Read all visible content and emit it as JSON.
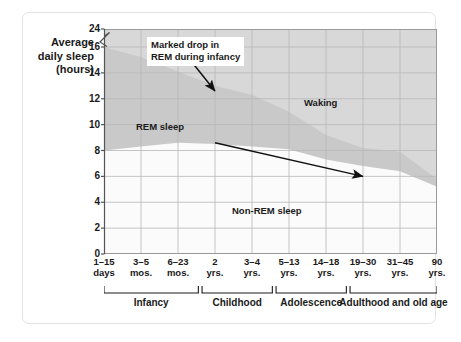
{
  "figure": {
    "y_axis_label_lines": [
      "Average",
      "daily sleep",
      "(hours)"
    ],
    "y_axis_title": "Average daily sleep (hours)"
  },
  "annotation": {
    "line1": "Marked drop in",
    "line2": "REM during infancy"
  },
  "region_labels": {
    "waking": "Waking",
    "rem": "REM sleep",
    "nonrem": "Non-REM sleep"
  },
  "brackets": [
    {
      "label": "Infancy",
      "start": 0,
      "end": 2.55
    },
    {
      "label": "Childhood",
      "start": 2.65,
      "end": 4.55
    },
    {
      "label": "Adolescence",
      "start": 4.65,
      "end": 6.55
    },
    {
      "label": "Adulthood and old age",
      "start": 6.65,
      "end": 9.0
    }
  ],
  "colors": {
    "waking_fill": "#d8d8d8",
    "rem_fill": "#c9c9c9",
    "nonrem_fill": "#fbfbfb",
    "grid": "#b8b8b8",
    "axis": "#555555",
    "text": "#1a1a1a",
    "frame": "#e3e3e3",
    "arrow": "#111111",
    "page_bg": "#ffffff"
  },
  "chart_data": {
    "type": "area",
    "title": "",
    "subtitle": "",
    "xlabel": "",
    "ylabel": "Average daily sleep (hours)",
    "ylim": [
      0,
      24
    ],
    "y_axis_break": {
      "between": [
        16,
        24
      ],
      "style": "zigzag"
    },
    "yticks": [
      0,
      2,
      4,
      6,
      8,
      10,
      12,
      14,
      16,
      24
    ],
    "ytick_labels": [
      "0",
      "2",
      "4",
      "6",
      "8",
      "10",
      "12",
      "14",
      "16",
      "24"
    ],
    "grid": true,
    "legend": "in-plot region labels",
    "categories": [
      "1–15 days",
      "3–5 mos.",
      "6–23 mos.",
      "2 yrs.",
      "3–4 yrs.",
      "5–13 yrs.",
      "14–18 yrs.",
      "19–30 yrs.",
      "31–45 yrs.",
      "90 yrs."
    ],
    "xtick_label_lines": [
      [
        "1–15",
        "days"
      ],
      [
        "3–5",
        "mos."
      ],
      [
        "6–23",
        "mos."
      ],
      [
        "2",
        "yrs."
      ],
      [
        "3–4",
        "yrs."
      ],
      [
        "5–13",
        "yrs."
      ],
      [
        "14–18",
        "yrs."
      ],
      [
        "19–30",
        "yrs."
      ],
      [
        "31–45",
        "yrs."
      ],
      [
        "90",
        "yrs."
      ]
    ],
    "series": [
      {
        "name": "Total sleep",
        "description": "Upper boundary of shaded sleep region; above it is Waking",
        "values": [
          16.0,
          15.2,
          14.1,
          13.0,
          12.3,
          11.0,
          9.2,
          8.2,
          7.9,
          5.8
        ]
      },
      {
        "name": "Non-REM sleep",
        "description": "Boundary between REM (upper band) and Non-REM (lower band)",
        "values": [
          8.0,
          8.3,
          8.6,
          8.5,
          8.3,
          8.1,
          7.3,
          6.8,
          6.4,
          5.2
        ]
      }
    ],
    "derived_series": [
      {
        "name": "REM sleep",
        "description": "Total sleep minus Non-REM sleep",
        "values": [
          8.0,
          6.9,
          5.5,
          4.5,
          4.0,
          2.9,
          1.9,
          1.4,
          1.5,
          0.6
        ]
      }
    ],
    "annotations": [
      {
        "text": "Marked drop in REM during infancy",
        "arrow_from": [
          "6–23 mos.",
          17.0
        ],
        "arrow_to": [
          "2 yrs.",
          12.6
        ]
      },
      {
        "text": "",
        "arrow_from": [
          "2 yrs.",
          8.6
        ],
        "arrow_to": [
          "19–30 yrs.",
          6.0
        ]
      }
    ]
  }
}
